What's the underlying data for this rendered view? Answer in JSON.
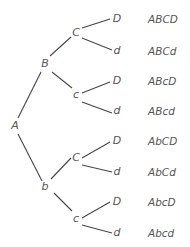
{
  "diagram": {
    "type": "probability-tree",
    "root": "A",
    "level1": [
      "B",
      "b"
    ],
    "level2": [
      "C",
      "c",
      "C",
      "c"
    ],
    "level3": [
      "D",
      "d",
      "D",
      "d",
      "D",
      "d",
      "D",
      "d"
    ],
    "outcomes": [
      "ABCD",
      "ABCd",
      "ABcD",
      "ABcd",
      "AbCD",
      "AbCd",
      "AbcD",
      "Abcd"
    ]
  }
}
